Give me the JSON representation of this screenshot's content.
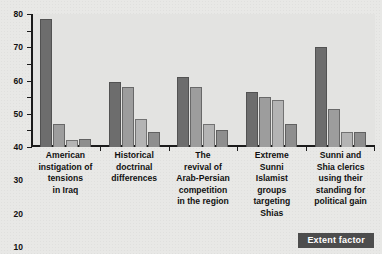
{
  "chart_data": {
    "type": "bar",
    "title": "",
    "xlabel": "",
    "ylabel": "",
    "ylim": [
      0,
      80
    ],
    "yticks": [
      "0",
      "10",
      "20",
      "30",
      "40",
      "50",
      "60",
      "70",
      "80"
    ],
    "grid": false,
    "legend_position": "bottom-right",
    "legend": [
      "Extent factor"
    ],
    "categories": [
      "American instigation of tensions in Iraq",
      "Historical doctrinal differences",
      "The revival of Arab-Persian competition in the region",
      "Extreme Sunni Islamist groups targeting Shias",
      "Sunni and Shia clerics using their standing for political gain"
    ],
    "series": [
      {
        "name": "Series 1",
        "values": [
          77,
          39,
          42,
          33,
          60
        ]
      },
      {
        "name": "Series 2",
        "values": [
          14,
          36,
          36,
          30,
          23
        ]
      },
      {
        "name": "Series 3",
        "values": [
          4,
          17,
          14,
          28,
          9
        ]
      },
      {
        "name": "Series 4",
        "values": [
          5,
          9,
          10,
          14,
          9
        ]
      }
    ],
    "colors": {
      "series_1": "#6d6d6d",
      "series_2": "#9d9d9d",
      "series_3": "#b4b4b4",
      "series_4": "#8e8e8e",
      "plot_background": "#e3e3e1",
      "page_background": "#e8e8e6",
      "axis": "#1b1b1b",
      "legend_background": "#4d4d4d",
      "legend_text": "#ffffff"
    }
  },
  "legend": {
    "extent_factor_label": "Extent factor"
  },
  "categories_display": [
    {
      "lines": [
        "American",
        "instigation of",
        "tensions",
        "in Iraq"
      ]
    },
    {
      "lines": [
        "Historical",
        "doctrinal",
        "differences"
      ]
    },
    {
      "lines": [
        "The",
        "revival of",
        "Arab-Persian",
        "competition",
        "in the region"
      ]
    },
    {
      "lines": [
        "Extreme",
        "Sunni",
        "Islamist",
        "groups",
        "targeting",
        "Shias"
      ]
    },
    {
      "lines": [
        "Sunni and",
        "Shia clerics",
        "using their",
        "standing for",
        "political gain"
      ]
    }
  ],
  "caption": {
    "partial_text": ""
  }
}
